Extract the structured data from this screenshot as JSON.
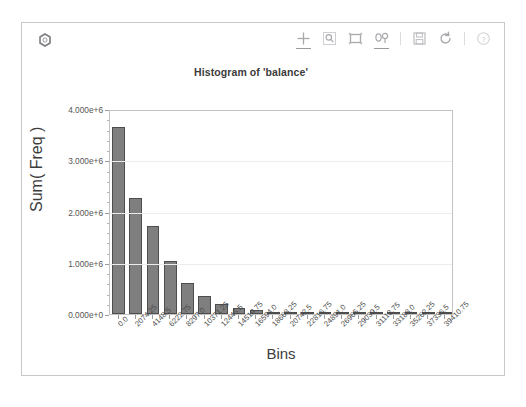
{
  "app": {
    "logo_icon": "hex-logo-icon"
  },
  "toolbar": {
    "items": [
      {
        "name": "pan-tool",
        "icon": "move-cross-icon",
        "label": "Pan",
        "active": true
      },
      {
        "name": "zoom-tool",
        "icon": "magnifier-icon",
        "label": "Zoom",
        "active": false
      },
      {
        "name": "box-select-tool",
        "icon": "box-select-icon",
        "label": "Box Select",
        "active": false
      },
      {
        "name": "axis-edit-tool",
        "icon": "axis-edit-icon",
        "label": "Edit Axis",
        "active": true
      },
      {
        "name": "save-tool",
        "icon": "floppy-disk-icon",
        "label": "Save",
        "active": false
      },
      {
        "name": "reset-tool",
        "icon": "refresh-icon",
        "label": "Reset",
        "active": false
      },
      {
        "name": "help-tool",
        "icon": "question-circle-icon",
        "label": "Help",
        "active": false
      }
    ]
  },
  "chart_data": {
    "type": "bar",
    "title": "Histogram of 'balance'",
    "xlabel": "Bins",
    "ylabel": "Sum( Freq )",
    "grid": true,
    "legend": null,
    "ylim": [
      0,
      4000000
    ],
    "ytick_labels": [
      "0.000e+0",
      "1.000e+6",
      "2.000e+6",
      "3.000e+6",
      "4.000e+6"
    ],
    "ytick_values": [
      0,
      1000000,
      2000000,
      3000000,
      4000000
    ],
    "categories": [
      "0.0",
      "2074.25",
      "4148.5",
      "6222.75",
      "8297.0",
      "10371.25",
      "12445.5",
      "14519.75",
      "16594.0",
      "18668.25",
      "20742.5",
      "22816.75",
      "24891.0",
      "26965.25",
      "29039.5",
      "31113.75",
      "33188.0",
      "35262.25",
      "37336.5",
      "39410.75"
    ],
    "values": [
      3640000,
      2270000,
      1720000,
      1040000,
      600000,
      345000,
      205000,
      125000,
      72000,
      42000,
      26000,
      16000,
      10000,
      6500,
      4000,
      2500,
      1600,
      1000,
      700,
      400
    ],
    "bar_color": "#7f7f7f",
    "bar_edge_color": "#4d4d4d"
  }
}
